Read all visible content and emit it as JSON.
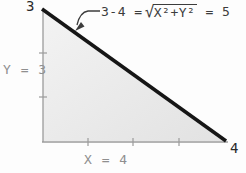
{
  "diagram": {
    "vertex_labels": {
      "top": "3",
      "right": "4"
    },
    "side_labels": {
      "vertical": "Y = 3",
      "horizontal": "X = 4"
    },
    "formula": {
      "prefix": "3-4 =",
      "radical_sign": "√",
      "radicand": "X²+Y²",
      "result": "= 5"
    },
    "axes": {
      "y_tick_count": 2,
      "x_tick_count": 3
    },
    "colors": {
      "background": "#fdfdfd",
      "triangle_fill_light": "#f3f3f3",
      "triangle_fill_dark": "#e2e2e2",
      "hypotenuse": "#161616",
      "axis": "#9b9b9b",
      "leader": "#3c3c3c",
      "vertex_label": "#2a2a2a",
      "side_label": "#8f8f8f"
    }
  }
}
